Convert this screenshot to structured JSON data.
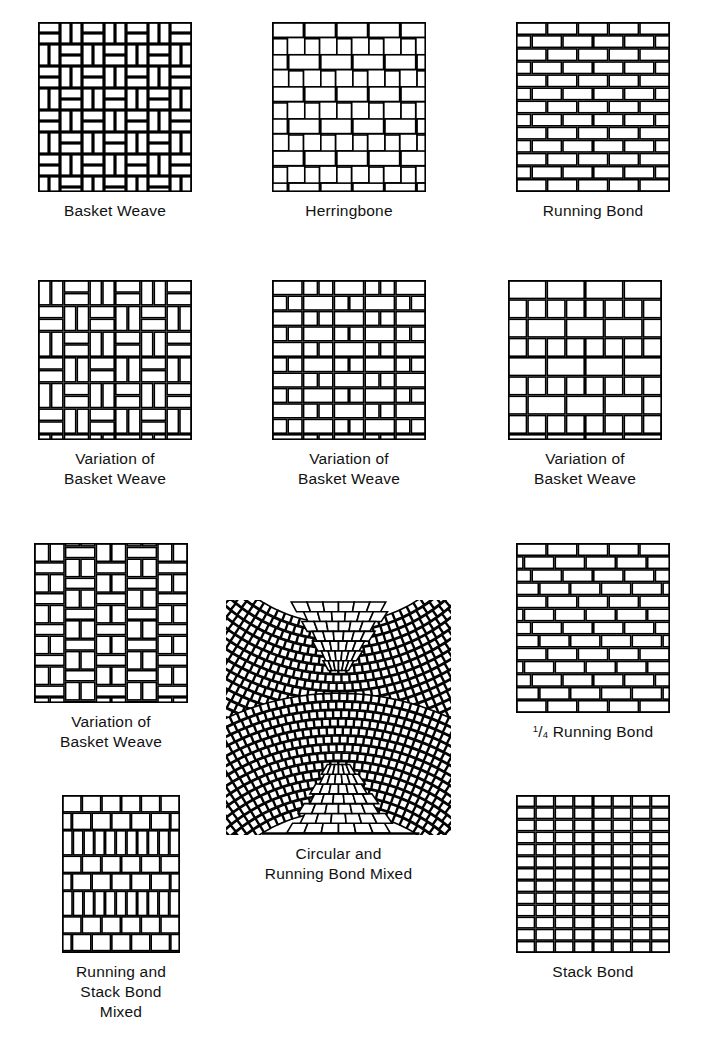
{
  "document": {
    "title": "Brick Paving Pattern Chart",
    "background_color": "#ffffff",
    "ink_color": "#000000"
  },
  "figures": [
    {
      "id": "basket-weave",
      "pattern": "basket-weave",
      "caption_lines": [
        "Basket Weave"
      ],
      "x": 38,
      "y": 22,
      "w": 154,
      "h": 170
    },
    {
      "id": "herringbone",
      "pattern": "herringbone",
      "caption_lines": [
        "Herringbone"
      ],
      "x": 272,
      "y": 22,
      "w": 154,
      "h": 170
    },
    {
      "id": "running-bond",
      "pattern": "running-bond",
      "caption_lines": [
        "Running Bond"
      ],
      "x": 516,
      "y": 22,
      "w": 154,
      "h": 170
    },
    {
      "id": "variation-basket-weave-1",
      "pattern": "basket-variation-1",
      "caption_lines": [
        "Variation of",
        "Basket Weave"
      ],
      "x": 38,
      "y": 280,
      "w": 154,
      "h": 160
    },
    {
      "id": "variation-basket-weave-2",
      "pattern": "basket-variation-2",
      "caption_lines": [
        "Variation of",
        "Basket Weave"
      ],
      "x": 272,
      "y": 280,
      "w": 154,
      "h": 160
    },
    {
      "id": "variation-basket-weave-3",
      "pattern": "basket-variation-3",
      "caption_lines": [
        "Variation of",
        "Basket Weave"
      ],
      "x": 508,
      "y": 280,
      "w": 154,
      "h": 160
    },
    {
      "id": "variation-basket-weave-4",
      "pattern": "basket-variation-4",
      "caption_lines": [
        "Variation of",
        "Basket Weave"
      ],
      "x": 34,
      "y": 543,
      "w": 154,
      "h": 160
    },
    {
      "id": "quarter-running-bond",
      "pattern": "quarter-running-bond",
      "caption_lines": [
        "¹/₄ Running Bond"
      ],
      "caption_html": "<sup>1</sup>/<sub>4</sub> Running Bond",
      "x": 516,
      "y": 543,
      "w": 154,
      "h": 170
    },
    {
      "id": "circular-running-bond-mixed",
      "pattern": "circular-fan",
      "caption_lines": [
        "Circular and",
        "Running Bond Mixed"
      ],
      "x": 226,
      "y": 600,
      "w": 225,
      "h": 235
    },
    {
      "id": "running-stack-bond-mixed",
      "pattern": "running-stack-mixed",
      "caption_lines": [
        "Running and",
        "Stack Bond Mixed"
      ],
      "x": 62,
      "y": 795,
      "w": 118,
      "h": 158
    },
    {
      "id": "stack-bond",
      "pattern": "stack-bond",
      "caption_lines": [
        "Stack Bond"
      ],
      "x": 516,
      "y": 795,
      "w": 154,
      "h": 158
    }
  ],
  "labels": {
    "basket_weave": "Basket Weave",
    "herringbone": "Herringbone",
    "running_bond": "Running Bond",
    "variation_of": "Variation of",
    "quarter_running_bond_numerator": "1",
    "quarter_running_bond_denominator": "4",
    "quarter_running_bond_rest": " Running Bond",
    "circular_line1": "Circular and",
    "circular_line2": "Running Bond Mixed",
    "running_stack_line1": "Running and",
    "running_stack_line2": "Stack Bond Mixed",
    "stack_bond": "Stack Bond"
  }
}
